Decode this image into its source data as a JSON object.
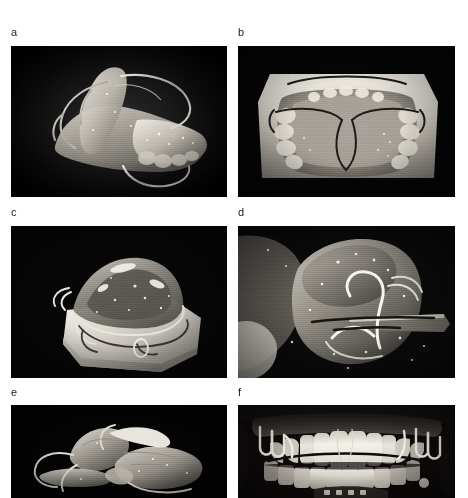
{
  "figure": {
    "type": "photographic-figure-plate",
    "layout": {
      "columns": 2,
      "rows": 3
    },
    "background_color": "#ffffff",
    "panels": [
      {
        "id": "a",
        "label": "a",
        "subject": "removable orthodontic appliance, lateral oblique view on black background",
        "background_color": "#000000",
        "x": 11,
        "y": 46,
        "width": 216,
        "height": 151,
        "label_x": 11,
        "label_y": 27
      },
      {
        "id": "b",
        "label": "b",
        "subject": "maxillary dental cast with removable plate appliance and labial bow, occlusal view",
        "background_color": "#000000",
        "x": 238,
        "y": 46,
        "width": 217,
        "height": 151,
        "label_x": 238,
        "label_y": 27
      },
      {
        "id": "c",
        "label": "c",
        "subject": "appliance seated on plaster dental cast, anterolateral view",
        "background_color": "#000000",
        "x": 11,
        "y": 226,
        "width": 216,
        "height": 152,
        "label_x": 11,
        "label_y": 207
      },
      {
        "id": "d",
        "label": "d",
        "subject": "close-up detail of acrylic appliance with embedded wire loop and spring",
        "background_color": "#000000",
        "x": 238,
        "y": 226,
        "width": 217,
        "height": 152,
        "label_x": 238,
        "label_y": 207
      },
      {
        "id": "e",
        "label": "e",
        "subject": "two-part appliance components lying on black background, lateral view",
        "background_color": "#000000",
        "x": 11,
        "y": 405,
        "width": 216,
        "height": 93,
        "label_x": 11,
        "label_y": 387
      },
      {
        "id": "f",
        "label": "f",
        "subject": "intraoral frontal photograph of appliance in situ on patient dentition",
        "background_color": "#000000",
        "x": 238,
        "y": 405,
        "width": 217,
        "height": 93,
        "label_x": 238,
        "label_y": 387
      }
    ]
  }
}
